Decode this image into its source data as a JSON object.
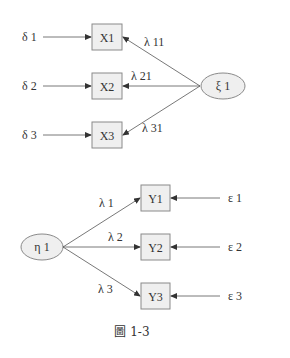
{
  "diagram": {
    "type": "measurement-model",
    "upper": {
      "latent": {
        "label": "ξ 1",
        "cx": 223,
        "cy": 86,
        "rx": 22,
        "ry": 13
      },
      "indicators": [
        {
          "label": "X1",
          "x": 92,
          "y": 24,
          "error": "δ 1",
          "loading": "λ 11"
        },
        {
          "label": "X2",
          "x": 92,
          "y": 73,
          "error": "δ 2",
          "loading": "λ 21"
        },
        {
          "label": "X3",
          "x": 92,
          "y": 122,
          "error": "δ 3",
          "loading": "λ 31"
        }
      ]
    },
    "lower": {
      "latent": {
        "label": "η 1",
        "cx": 42,
        "cy": 247,
        "rx": 21,
        "ry": 13
      },
      "indicators": [
        {
          "label": "Y1",
          "x": 141,
          "y": 185,
          "error": "ε 1",
          "loading": "λ 1"
        },
        {
          "label": "Y2",
          "x": 141,
          "y": 234,
          "error": "ε 2",
          "loading": "λ 2"
        },
        {
          "label": "Y3",
          "x": 141,
          "y": 283,
          "error": "ε 3",
          "loading": "λ 3"
        }
      ]
    },
    "caption": "圖 1-3"
  }
}
